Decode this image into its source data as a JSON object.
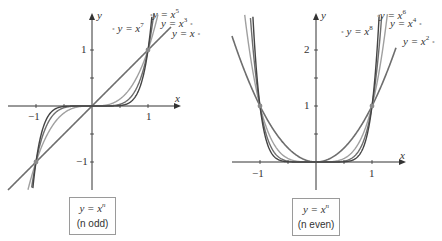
{
  "chart_data": [
    {
      "type": "line",
      "title": "y = x^n (n odd)",
      "caption_line1": "y = x",
      "caption_exp": "n",
      "caption_line2": "(n odd)",
      "xlabel": "x",
      "ylabel": "y",
      "xlim": [
        -1.5,
        1.6
      ],
      "ylim": [
        -1.5,
        1.65
      ],
      "x_ticks": [
        -1,
        1
      ],
      "y_ticks": [
        -1,
        1
      ],
      "x_tick_labels": [
        "−1",
        "1"
      ],
      "y_tick_labels": [
        "−1",
        "1"
      ],
      "grid": false,
      "series": [
        {
          "name": "y = x",
          "exponent": 1,
          "label_base": "y = x",
          "label_exp": ""
        },
        {
          "name": "y = x^3",
          "exponent": 3,
          "label_base": "y = x",
          "label_exp": "3"
        },
        {
          "name": "y = x^5",
          "exponent": 5,
          "label_base": "y = x",
          "label_exp": "5"
        },
        {
          "name": "y = x^7",
          "exponent": 7,
          "label_base": "y = x",
          "label_exp": "7"
        }
      ],
      "intersection_points": [
        [
          -1,
          -1
        ],
        [
          0,
          0
        ],
        [
          1,
          1
        ]
      ]
    },
    {
      "type": "line",
      "title": "y = x^n (n even)",
      "caption_line1": "y = x",
      "caption_exp": "n",
      "caption_line2": "(n even)",
      "xlabel": "x",
      "ylabel": "y",
      "xlim": [
        -1.5,
        1.6
      ],
      "ylim": [
        -0.5,
        2.65
      ],
      "x_ticks": [
        -1,
        1
      ],
      "y_ticks": [
        1,
        2
      ],
      "x_tick_labels": [
        "−1",
        "1"
      ],
      "y_tick_labels": [
        "1",
        "2"
      ],
      "grid": false,
      "series": [
        {
          "name": "y = x^2",
          "exponent": 2,
          "label_base": "y = x",
          "label_exp": "2"
        },
        {
          "name": "y = x^4",
          "exponent": 4,
          "label_base": "y = x",
          "label_exp": "4"
        },
        {
          "name": "y = x^6",
          "exponent": 6,
          "label_base": "y = x",
          "label_exp": "6"
        },
        {
          "name": "y = x^8",
          "exponent": 8,
          "label_base": "y = x",
          "label_exp": "8"
        }
      ],
      "intersection_points": [
        [
          -1,
          1
        ],
        [
          0,
          0
        ],
        [
          1,
          1
        ]
      ]
    }
  ],
  "colors": {
    "axis": "#333333",
    "curve_dark": "#444444",
    "curve_mid": "#6e6e6e",
    "curve_light": "#a0a0a0",
    "box_border": "#9a9a9a"
  }
}
